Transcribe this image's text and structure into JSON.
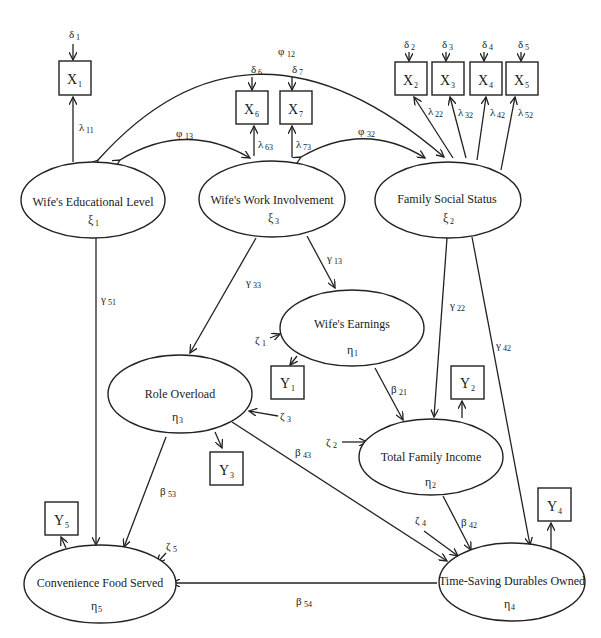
{
  "diagram": {
    "type": "structural-equation-model",
    "latent_exogenous": [
      {
        "id": "xi1",
        "label": "Wife's Educational Level",
        "symbol": "ξ",
        "sub": "1"
      },
      {
        "id": "xi3",
        "label": "Wife's Work Involvement",
        "symbol": "ξ",
        "sub": "3"
      },
      {
        "id": "xi2",
        "label": "Family Social Status",
        "symbol": "ξ",
        "sub": "2"
      }
    ],
    "latent_endogenous": [
      {
        "id": "eta1",
        "label": "Wife's Earnings",
        "symbol": "η",
        "sub": "1"
      },
      {
        "id": "eta3",
        "label": "Role Overload",
        "symbol": "η",
        "sub": "3"
      },
      {
        "id": "eta2",
        "label": "Total Family Income",
        "symbol": "η",
        "sub": "2"
      },
      {
        "id": "eta5",
        "label": "Convenience Food Served",
        "symbol": "η",
        "sub": "5"
      },
      {
        "id": "eta4",
        "label": "Time-Saving Durables Owned",
        "symbol": "η",
        "sub": "4"
      }
    ],
    "observed_x": [
      {
        "id": "X1",
        "label": "X",
        "sub": "1",
        "error": "δ",
        "error_sub": "1",
        "loading": "λ",
        "loading_sub": "11"
      },
      {
        "id": "X2",
        "label": "X",
        "sub": "2",
        "error": "δ",
        "error_sub": "2",
        "loading": "λ",
        "loading_sub": "22"
      },
      {
        "id": "X3",
        "label": "X",
        "sub": "3",
        "error": "δ",
        "error_sub": "3",
        "loading": "λ",
        "loading_sub": "32"
      },
      {
        "id": "X4",
        "label": "X",
        "sub": "4",
        "error": "δ",
        "error_sub": "4",
        "loading": "λ",
        "loading_sub": "42"
      },
      {
        "id": "X5",
        "label": "X",
        "sub": "5",
        "error": "δ",
        "error_sub": "5",
        "loading": "λ",
        "loading_sub": "52"
      },
      {
        "id": "X6",
        "label": "X",
        "sub": "6",
        "error": "δ",
        "error_sub": "6",
        "loading": "λ",
        "loading_sub": "63"
      },
      {
        "id": "X7",
        "label": "X",
        "sub": "7",
        "error": "δ",
        "error_sub": "7",
        "loading": "λ",
        "loading_sub": "73"
      }
    ],
    "observed_y": [
      {
        "id": "Y1",
        "label": "Y",
        "sub": "1"
      },
      {
        "id": "Y2",
        "label": "Y",
        "sub": "2"
      },
      {
        "id": "Y3",
        "label": "Y",
        "sub": "3"
      },
      {
        "id": "Y4",
        "label": "Y",
        "sub": "4"
      },
      {
        "id": "Y5",
        "label": "Y",
        "sub": "5"
      }
    ],
    "covariances": [
      {
        "symbol": "φ",
        "sub": "12",
        "between": [
          "xi1",
          "xi2"
        ]
      },
      {
        "symbol": "φ",
        "sub": "13",
        "between": [
          "xi1",
          "xi3"
        ]
      },
      {
        "symbol": "φ",
        "sub": "32",
        "between": [
          "xi3",
          "xi2"
        ]
      }
    ],
    "gamma_paths": [
      {
        "symbol": "γ",
        "sub": "51",
        "from": "xi1",
        "to": "eta5"
      },
      {
        "symbol": "γ",
        "sub": "33",
        "from": "xi3",
        "to": "eta3"
      },
      {
        "symbol": "γ",
        "sub": "13",
        "from": "xi3",
        "to": "eta1"
      },
      {
        "symbol": "γ",
        "sub": "22",
        "from": "xi2",
        "to": "eta2"
      },
      {
        "symbol": "γ",
        "sub": "42",
        "from": "xi2",
        "to": "eta4"
      }
    ],
    "beta_paths": [
      {
        "symbol": "β",
        "sub": "21",
        "from": "eta1",
        "to": "eta2"
      },
      {
        "symbol": "β",
        "sub": "43",
        "from": "eta3",
        "to": "eta4"
      },
      {
        "symbol": "β",
        "sub": "53",
        "from": "eta3",
        "to": "eta5"
      },
      {
        "symbol": "β",
        "sub": "42",
        "from": "eta2",
        "to": "eta4"
      },
      {
        "symbol": "β",
        "sub": "54",
        "from": "eta4",
        "to": "eta5"
      }
    ],
    "disturbances": [
      {
        "symbol": "ζ",
        "sub": "1",
        "to": "eta1"
      },
      {
        "symbol": "ζ",
        "sub": "2",
        "to": "eta2"
      },
      {
        "symbol": "ζ",
        "sub": "3",
        "to": "eta3"
      },
      {
        "symbol": "ζ",
        "sub": "4",
        "to": "eta4"
      },
      {
        "symbol": "ζ",
        "sub": "5",
        "to": "eta5"
      }
    ]
  },
  "labels": {
    "xi1_name": "Wife's Educational Level",
    "xi3_name": "Wife's Work Involvement",
    "xi2_name": "Family Social Status",
    "eta1_name": "Wife's Earnings",
    "eta3_name": "Role Overload",
    "eta2_name": "Total Family Income",
    "eta5_name": "Convenience Food Served",
    "eta4_name": "Time-Saving Durables Owned",
    "xi": "ξ",
    "eta": "η",
    "delta": "δ",
    "lambda": "λ",
    "phi": "φ",
    "gamma": "γ",
    "beta": "β",
    "zeta": "ζ",
    "X": "X",
    "Y": "Y",
    "s1": "1",
    "s2": "2",
    "s3": "3",
    "s4": "4",
    "s5": "5",
    "s6": "6",
    "s7": "7",
    "s11": "11",
    "s12": "12",
    "s13": "13",
    "s21": "21",
    "s22": "22",
    "s32": "32",
    "s33": "33",
    "s42": "42",
    "s43": "43",
    "s51": "51",
    "s52": "52",
    "s53": "53",
    "s54": "54",
    "s63": "63",
    "s73": "73"
  }
}
